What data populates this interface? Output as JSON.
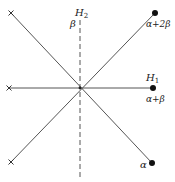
{
  "diagram": {
    "type": "root-system",
    "center": [
      80,
      88
    ],
    "colors": {
      "line": "#555555",
      "point": "#111111",
      "text": "#222222"
    },
    "lines": [
      {
        "name": "diagonal-up",
        "from": [
          11,
          162
        ],
        "to": [
          155,
          13
        ],
        "style": "solid"
      },
      {
        "name": "diagonal-down",
        "from": [
          11,
          13
        ],
        "to": [
          152,
          163
        ],
        "style": "solid"
      },
      {
        "name": "horizontal-H1",
        "from": [
          9,
          88
        ],
        "to": [
          153,
          88
        ],
        "style": "solid"
      },
      {
        "name": "vertical-H2",
        "from": [
          80,
          20
        ],
        "to": [
          80,
          178
        ],
        "style": "dashed"
      }
    ],
    "points": [
      {
        "name": "alpha-plus-2beta",
        "pos": [
          155,
          13
        ],
        "marker": "dot"
      },
      {
        "name": "alpha-plus-beta",
        "pos": [
          153,
          88
        ],
        "marker": "dot"
      },
      {
        "name": "alpha",
        "pos": [
          152,
          163
        ],
        "marker": "dot"
      },
      {
        "name": "cross-top-left",
        "pos": [
          11,
          13
        ],
        "marker": "cross"
      },
      {
        "name": "cross-left",
        "pos": [
          9,
          88
        ],
        "marker": "cross"
      },
      {
        "name": "cross-bottom-left",
        "pos": [
          11,
          162
        ],
        "marker": "cross"
      }
    ],
    "labels": {
      "H2": "H",
      "H2_sub": "2",
      "beta": "β",
      "H1": "H",
      "H1_sub": "1",
      "alpha_plus_2beta": "α+2β",
      "alpha_plus_beta": "α+β",
      "alpha": "α"
    }
  }
}
